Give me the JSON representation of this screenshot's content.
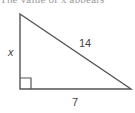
{
  "header": {
    "cutoff_text": "The value of x appears"
  },
  "diagram": {
    "type": "right-triangle",
    "colors": {
      "stroke": "#555555",
      "label": "#444444",
      "background": "#ffffff"
    },
    "vertices": {
      "top": [
        20,
        14
      ],
      "right_angle": [
        20,
        89
      ],
      "right": [
        131,
        89
      ]
    },
    "labels": {
      "vertical_leg": "x",
      "hypotenuse": "14",
      "horizontal_leg": "7"
    },
    "right_angle_marker": true
  }
}
